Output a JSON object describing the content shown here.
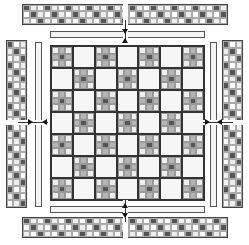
{
  "diagram": {
    "title": "",
    "colors": {
      "dark": "#555555",
      "mid": "#b5b5b5",
      "light": "#eeeeee",
      "white": "#ffffff",
      "outline": "#333333"
    },
    "center_grid": {
      "rows": 7,
      "cols": 7,
      "pattern": "alternating nine-patch / plain, nine-patch at corners"
    },
    "nine_patch": [
      "light",
      "mid",
      "light",
      "mid",
      "dark",
      "mid",
      "light",
      "mid",
      "light"
    ],
    "border_strip": {
      "rows": 3,
      "pattern_row_1": "dark,light,light",
      "note": "3-row checker of dark/light/white squares"
    },
    "arrows": [
      "top",
      "bottom",
      "left",
      "right"
    ]
  }
}
